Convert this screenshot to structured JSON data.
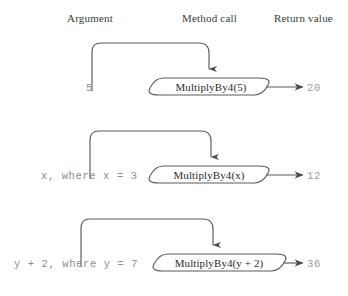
{
  "figure": {
    "type": "diagram",
    "subtype": "method-call-argument-flow",
    "background_color": "#ffffff",
    "stroke_color": "#5a5a5a",
    "text_color": "#2b2b2b",
    "muted_text_color": "#8c8c8c"
  },
  "headers": {
    "argument": "Argument",
    "method_call": "Method call",
    "return_value": "Return value"
  },
  "rows": [
    {
      "argument": "5",
      "method_call": "MultiplyBy4(5)",
      "return_value": "20"
    },
    {
      "argument": "x, where x = 3",
      "method_call": "MultiplyBy4(x)",
      "return_value": "12"
    },
    {
      "argument": "y + 2, where y = 7",
      "method_call": "MultiplyBy4(y + 2)",
      "return_value": "36"
    }
  ]
}
